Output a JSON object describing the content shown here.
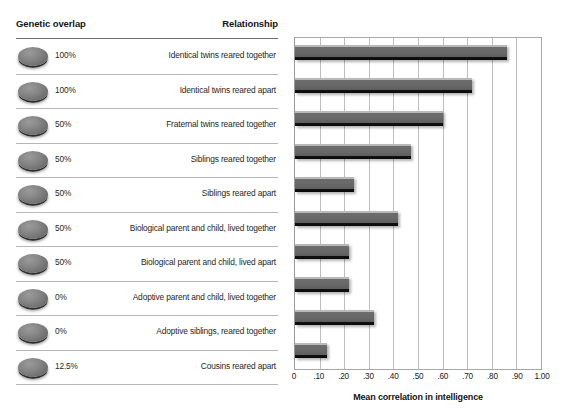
{
  "table": {
    "header": {
      "genetic_overlap": "Genetic overlap",
      "relationship": "Relationship"
    },
    "rows": [
      {
        "genetic_overlap": "100%",
        "relationship": "Identical twins reared together"
      },
      {
        "genetic_overlap": "100%",
        "relationship": "Identical twins reared apart"
      },
      {
        "genetic_overlap": "50%",
        "relationship": "Fraternal twins reared together"
      },
      {
        "genetic_overlap": "50%",
        "relationship": "Siblings reared together"
      },
      {
        "genetic_overlap": "50%",
        "relationship": "Siblings reared apart"
      },
      {
        "genetic_overlap": "50%",
        "relationship": "Biological parent and child, lived together"
      },
      {
        "genetic_overlap": "50%",
        "relationship": "Biological parent and child, lived apart"
      },
      {
        "genetic_overlap": "0%",
        "relationship": "Adoptive parent and child, lived together"
      },
      {
        "genetic_overlap": "0%",
        "relationship": "Adoptive siblings, reared together"
      },
      {
        "genetic_overlap": "12.5%",
        "relationship": "Cousins reared apart"
      }
    ]
  },
  "chart_data": {
    "type": "bar",
    "orientation": "horizontal",
    "title": "",
    "xlabel": "Mean correlation in intelligence",
    "ylabel": "",
    "xlim": [
      0,
      1.0
    ],
    "xticks": [
      0,
      0.1,
      0.2,
      0.3,
      0.4,
      0.5,
      0.6,
      0.7,
      0.8,
      0.9,
      1.0
    ],
    "xtick_labels": [
      "0",
      ".10",
      ".20",
      ".30",
      ".40",
      ".50",
      ".60",
      ".70",
      ".80",
      ".90",
      "1.00"
    ],
    "grid": "vertical",
    "legend": "none",
    "bar_color": "#6b6b6b",
    "categories": [
      "Identical twins reared together",
      "Identical twins reared apart",
      "Fraternal twins reared together",
      "Siblings reared together",
      "Siblings reared apart",
      "Biological parent and child, lived together",
      "Biological parent and child, lived apart",
      "Adoptive parent and child, lived together",
      "Adoptive siblings, reared together",
      "Cousins reared apart"
    ],
    "values": [
      0.86,
      0.72,
      0.6,
      0.47,
      0.24,
      0.42,
      0.22,
      0.22,
      0.32,
      0.13
    ]
  }
}
